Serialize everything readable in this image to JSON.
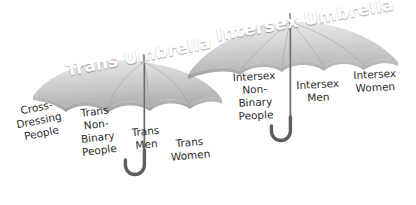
{
  "figure": {
    "background_color": "#ffffff",
    "palette": {
      "canopy_light": "#e2e2e2",
      "canopy_mid": "#c9c9c9",
      "canopy_dark": "#a8a8a8",
      "canopy_edge": "#8d8d8d",
      "handle": "#6f6f6f",
      "title_color": "#ffffff",
      "label_color": "#2b2b2b"
    }
  },
  "umbrellas": [
    {
      "id": "trans",
      "title": "Trans Umbrella",
      "labels": [
        "Cross-\nDressing\nPeople",
        "Trans\nNon-\nBinary\nPeople",
        "Trans\nMen",
        "Trans\nWomen"
      ]
    },
    {
      "id": "intersex",
      "title": "Intersex Umbrella",
      "labels": [
        "Intersex\nNon-\nBinary\nPeople",
        "Intersex\nMen",
        "Intersex\nWomen"
      ]
    }
  ]
}
